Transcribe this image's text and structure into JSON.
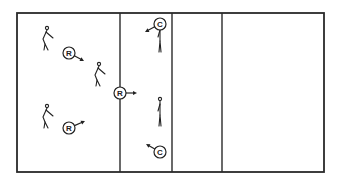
{
  "diagram": {
    "type": "court-positioning",
    "court": {
      "outer": {
        "x": 17,
        "y": 13,
        "width": 307,
        "height": 159
      },
      "dividers_x": [
        120,
        172,
        222
      ],
      "line_color": "#2a2a2a"
    },
    "players": [
      {
        "id": "r1",
        "label": "R",
        "role": "receiver",
        "figure": "bent",
        "fx": 47,
        "fy": 40,
        "cx": 69,
        "cy": 53,
        "arrow_to": [
          84,
          61
        ]
      },
      {
        "id": "r2",
        "label": "R",
        "role": "receiver",
        "figure": "bent",
        "fx": 99,
        "fy": 76,
        "cx": 120,
        "cy": 93,
        "arrow_to": [
          137,
          93
        ]
      },
      {
        "id": "r3",
        "label": "R",
        "role": "receiver",
        "figure": "bent",
        "fx": 47,
        "fy": 118,
        "cx": 69,
        "cy": 128,
        "arrow_to": [
          85,
          121
        ]
      },
      {
        "id": "c1",
        "label": "C",
        "role": "coach",
        "figure": "standing",
        "fx": 160,
        "fy": 38,
        "cx": 160,
        "cy": 24,
        "arrow_to": [
          145,
          32
        ]
      },
      {
        "id": "c2",
        "label": "C",
        "role": "coach",
        "figure": "standing",
        "fx": 160,
        "fy": 112,
        "cx": 160,
        "cy": 152,
        "arrow_to": [
          146,
          144
        ]
      }
    ]
  }
}
